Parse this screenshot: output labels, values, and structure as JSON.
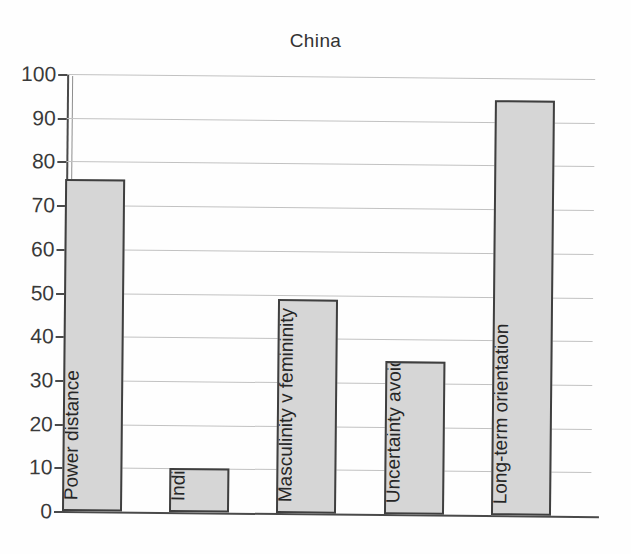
{
  "chart_data": {
    "type": "bar",
    "title": "China",
    "xlabel": "",
    "ylabel": "",
    "ylim": [
      0,
      100
    ],
    "ytick_step": 10,
    "yticks": [
      "100",
      "90",
      "80",
      "70",
      "60",
      "50",
      "40",
      "30",
      "20",
      "10",
      "0"
    ],
    "grid": true,
    "legend": "none",
    "orientation": "vertical",
    "bar_fill_color": "#d6d6d6",
    "bar_edge_color": "#3f3f3f",
    "label_placement": "inside-bar-rotated-bottom",
    "categories": [
      "Power distance",
      "Individualism v collectivism",
      "Masculinity v femininity",
      "Uncertainty avoidance",
      "Long-term orientation"
    ],
    "values": [
      76,
      10,
      49,
      35,
      95
    ]
  }
}
